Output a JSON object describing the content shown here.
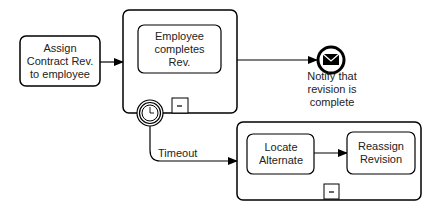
{
  "diagram": {
    "tasks": {
      "assign": "Assign Contract Rev. to employee",
      "employee_completes": "Employee completes Rev.",
      "locate": "Locate Alternate",
      "reassign": "Reassign Revision"
    },
    "end_event_label": "Notify that revision is complete",
    "flow_label_timeout": "Timeout",
    "collapse_marker": "-"
  }
}
